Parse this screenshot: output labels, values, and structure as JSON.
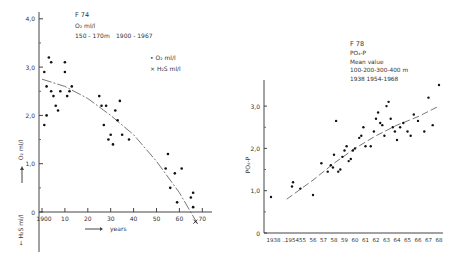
{
  "chart_data": [
    {
      "type": "scatter",
      "id": "F74",
      "title": "F 74",
      "subtitle_lines": [
        "O₂ ml/l",
        "150 - 170m",
        "1900 - 1967"
      ],
      "legend": [
        {
          "marker": "•",
          "label": "O₂ ml/l"
        },
        {
          "marker": "×",
          "label": "H₂S ml/l"
        }
      ],
      "xlabel": "years",
      "ylabel_pos": "O₂ ml/l",
      "ylabel_neg": "H₂S ml/l",
      "x_ticks": [
        "1900",
        "10",
        "20",
        "30",
        "40",
        "50",
        "60",
        "70"
      ],
      "x_tick_values": [
        0,
        10,
        20,
        30,
        40,
        50,
        60,
        70
      ],
      "y_ticks": [
        "0",
        "1,0",
        "2,0",
        "3,0",
        "4,0"
      ],
      "y_tick_values": [
        0,
        1.0,
        2.0,
        3.0,
        4.0
      ],
      "xlim": [
        0,
        72
      ],
      "ylim": [
        -0.8,
        4.2
      ],
      "grid": false,
      "series": [
        {
          "name": "O₂ ml/l",
          "points": [
            [
              1,
              2.9
            ],
            [
              1,
              1.8
            ],
            [
              2,
              2.6
            ],
            [
              2,
              2.0
            ],
            [
              3,
              3.2
            ],
            [
              4,
              3.1
            ],
            [
              4,
              2.5
            ],
            [
              5,
              2.4
            ],
            [
              6,
              2.2
            ],
            [
              7,
              2.1
            ],
            [
              8,
              2.5
            ],
            [
              10,
              2.9
            ],
            [
              10,
              3.1
            ],
            [
              11,
              2.4
            ],
            [
              12,
              2.5
            ],
            [
              13,
              2.6
            ],
            [
              25,
              2.4
            ],
            [
              26,
              2.2
            ],
            [
              27,
              1.8
            ],
            [
              28,
              2.2
            ],
            [
              29,
              1.5
            ],
            [
              30,
              1.6
            ],
            [
              31,
              1.4
            ],
            [
              32,
              2.1
            ],
            [
              33,
              1.9
            ],
            [
              34,
              2.3
            ],
            [
              35,
              1.6
            ],
            [
              38,
              1.5
            ],
            [
              54,
              0.9
            ],
            [
              55,
              1.2
            ],
            [
              56,
              0.5
            ],
            [
              58,
              0.8
            ],
            [
              59,
              0.2
            ],
            [
              61,
              0.9
            ],
            [
              65,
              0.3
            ],
            [
              66,
              0.1
            ],
            [
              66,
              0.4
            ]
          ]
        },
        {
          "name": "H₂S ml/l",
          "points": [
            [
              67,
              -0.2
            ]
          ]
        }
      ],
      "trend_line": [
        [
          0,
          2.75
        ],
        [
          10,
          2.6
        ],
        [
          20,
          2.35
        ],
        [
          30,
          2.0
        ],
        [
          40,
          1.6
        ],
        [
          50,
          1.05
        ],
        [
          60,
          0.4
        ],
        [
          68,
          -0.25
        ]
      ]
    },
    {
      "type": "scatter",
      "id": "F78",
      "title": "F 78",
      "subtitle_lines": [
        "PO₄-P",
        "Mean value",
        "100-200-300-400 m",
        "1938   1954-1968"
      ],
      "ylabel": "PO₄-P",
      "x_ticks": [
        "1938 ...",
        "1954",
        "55",
        "56",
        "57",
        "58",
        "59",
        "60",
        "61",
        "62",
        "63",
        "64",
        "65",
        "66",
        "67",
        "68"
      ],
      "y_ticks": [
        "0",
        "1,0",
        "2,0",
        "3,0"
      ],
      "y_tick_values": [
        0,
        1.0,
        2.0,
        3.0
      ],
      "ylim": [
        0,
        3.6
      ],
      "grid": false,
      "series": [
        {
          "name": "PO₄-P mean value",
          "points": [
            [
              1938,
              0.85
            ],
            [
              1954.0,
              1.1
            ],
            [
              1954.1,
              1.2
            ],
            [
              1954.8,
              1.05
            ],
            [
              1956.0,
              0.9
            ],
            [
              1956.8,
              1.65
            ],
            [
              1957.4,
              1.45
            ],
            [
              1957.7,
              1.6
            ],
            [
              1957.9,
              1.55
            ],
            [
              1958.0,
              1.85
            ],
            [
              1958.2,
              2.65
            ],
            [
              1958.4,
              1.45
            ],
            [
              1958.6,
              1.5
            ],
            [
              1958.8,
              1.8
            ],
            [
              1959.0,
              1.95
            ],
            [
              1959.2,
              2.05
            ],
            [
              1959.4,
              1.7
            ],
            [
              1959.6,
              1.75
            ],
            [
              1959.8,
              1.95
            ],
            [
              1960.0,
              2.0
            ],
            [
              1960.4,
              2.25
            ],
            [
              1960.6,
              2.3
            ],
            [
              1960.8,
              2.5
            ],
            [
              1961.0,
              2.05
            ],
            [
              1961.5,
              2.05
            ],
            [
              1961.8,
              2.4
            ],
            [
              1962.0,
              2.7
            ],
            [
              1962.2,
              2.85
            ],
            [
              1962.4,
              2.6
            ],
            [
              1962.6,
              2.55
            ],
            [
              1962.8,
              2.3
            ],
            [
              1963.0,
              3.0
            ],
            [
              1963.2,
              3.1
            ],
            [
              1963.4,
              2.7
            ],
            [
              1963.6,
              2.5
            ],
            [
              1963.8,
              2.4
            ],
            [
              1964.0,
              2.2
            ],
            [
              1964.3,
              2.5
            ],
            [
              1964.6,
              2.6
            ],
            [
              1965.0,
              2.4
            ],
            [
              1965.3,
              2.3
            ],
            [
              1965.6,
              2.8
            ],
            [
              1966.0,
              2.65
            ],
            [
              1966.6,
              2.4
            ],
            [
              1967.0,
              3.2
            ],
            [
              1967.4,
              2.55
            ],
            [
              1968.0,
              3.5
            ]
          ]
        }
      ],
      "trend_line": [
        [
          1953.5,
          0.8
        ],
        [
          1956,
          1.25
        ],
        [
          1958,
          1.65
        ],
        [
          1960,
          2.0
        ],
        [
          1962,
          2.3
        ],
        [
          1964,
          2.55
        ],
        [
          1966,
          2.75
        ],
        [
          1968,
          3.0
        ]
      ]
    }
  ]
}
